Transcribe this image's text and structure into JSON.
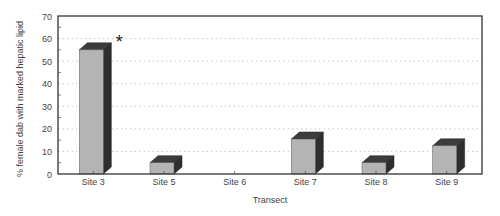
{
  "chart_data": {
    "type": "bar",
    "style": "3d-column",
    "title": "",
    "xlabel": "Transect",
    "ylabel": "% female dab with marked hepatic lipid",
    "categories": [
      "Site 3",
      "Site 5",
      "Site 6",
      "Site 7",
      "Site 8",
      "Site 9"
    ],
    "values": [
      55,
      5,
      0,
      15.5,
      5,
      12.5
    ],
    "ylim": [
      0,
      70
    ],
    "yticks": [
      0,
      10,
      20,
      30,
      40,
      50,
      60,
      70
    ],
    "grid": "horizontal-dotted",
    "legend": null,
    "annotations": [
      {
        "category": "Site 3",
        "text": "*",
        "meaning": "significant"
      }
    ]
  },
  "colors": {
    "bar_front": "#b4b4b4",
    "bar_side": "#2e2e2e",
    "bar_top": "#3c3c3c",
    "frame": "#333333",
    "grid": "#bbbbbb"
  }
}
